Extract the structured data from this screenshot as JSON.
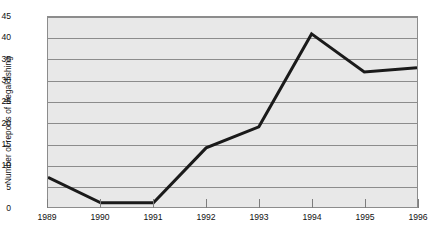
{
  "chart_data": {
    "type": "line",
    "title": "",
    "xlabel": "",
    "ylabel": "Number of reports of illegal fishing",
    "categories": [
      "1989",
      "1990",
      "1991",
      "1992",
      "1993",
      "1994",
      "1995",
      "1996"
    ],
    "x": [
      1989,
      1990,
      1991,
      1992,
      1993,
      1994,
      1995,
      1996
    ],
    "values": [
      7,
      1,
      1,
      14,
      19,
      41,
      32,
      33
    ],
    "series": [
      {
        "name": "Number of reports of illegal fishing",
        "values": [
          7,
          1,
          1,
          14,
          19,
          41,
          32,
          33
        ]
      }
    ],
    "ylim": [
      0,
      45
    ],
    "ytick_labels": [
      "0",
      "5",
      "10",
      "15",
      "20",
      "25",
      "30",
      "35",
      "40",
      "45"
    ],
    "yticks": [
      0,
      5,
      10,
      15,
      20,
      25,
      30,
      35,
      40,
      45
    ],
    "xtick_labels": [
      "1989",
      "1990",
      "1991",
      "1992",
      "1993",
      "1994",
      "1995",
      "1996"
    ],
    "grid": "horizontal",
    "legend": "none",
    "line_color": "#1a1a1a",
    "plot_background": "#e8e8e8",
    "grid_color": "#8c8c8c",
    "axis_color": "#8c8c8c",
    "text_color": "#111111"
  }
}
